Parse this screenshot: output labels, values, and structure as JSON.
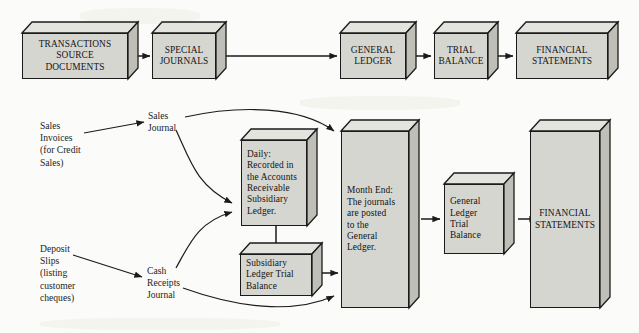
{
  "diagram": {
    "colors": {
      "box_face": "#d6d6d1",
      "box_top": "#e4e4df",
      "box_side": "#bfbfb8",
      "outline": "#1b1b1b",
      "background": "#fbfbf9"
    }
  },
  "top_row": {
    "boxes": [
      {
        "id": "transactions-source-documents",
        "label": "TRANSACTIONS\nSOURCE\nDOCUMENTS"
      },
      {
        "id": "special-journals",
        "label": "SPECIAL\nJOURNALS"
      },
      {
        "id": "general-ledger",
        "label": "GENERAL\nLEDGER"
      },
      {
        "id": "trial-balance",
        "label": "TRIAL\nBALANCE"
      },
      {
        "id": "financial-statements",
        "label": "FINANCIAL\nSTATEMENTS"
      }
    ],
    "connectors": [
      {
        "from": "transactions-source-documents",
        "to": "special-journals",
        "kind": "straight-arrow"
      },
      {
        "from": "special-journals",
        "to": "general-ledger",
        "kind": "straight-arrow"
      },
      {
        "from": "general-ledger",
        "to": "trial-balance",
        "kind": "straight-arrow"
      },
      {
        "from": "trial-balance",
        "to": "financial-statements",
        "kind": "straight-arrow"
      }
    ]
  },
  "bottom_row": {
    "source_labels": [
      {
        "id": "sales-invoices",
        "label": "Sales\nInvoices\n(for Credit\nSales)"
      },
      {
        "id": "deposit-slips",
        "label": "Deposit\nSlips\n(listing\ncustomer\ncheques)"
      }
    ],
    "journal_labels": [
      {
        "id": "sales-journal",
        "label": "Sales\nJournal"
      },
      {
        "id": "cash-receipts-journal",
        "label": "Cash\nReceipts\nJournal"
      }
    ],
    "boxes": [
      {
        "id": "daily-subsidiary-ledger",
        "label": "Daily:\nRecorded in\nthe Accounts\nReceivable\nSubsidiary\nLedger."
      },
      {
        "id": "subsidiary-ledger-trial-balance",
        "label": "Subsidiary\nLedger Trial\nBalance"
      },
      {
        "id": "month-end-general-ledger",
        "label": "Month End:\nThe journals\nare posted\nto the\nGeneral\nLedger."
      },
      {
        "id": "general-ledger-trial-balance",
        "label": "General\nLedger\nTrial\nBalance"
      },
      {
        "id": "financial-statements-bottom",
        "label": "FINANCIAL\nSTATEMENTS"
      }
    ],
    "connectors": [
      {
        "from": "sales-invoices",
        "to": "sales-journal",
        "kind": "straight-arrow"
      },
      {
        "from": "deposit-slips",
        "to": "cash-receipts-journal",
        "kind": "straight-arrow"
      },
      {
        "from": "sales-journal",
        "to": "month-end-general-ledger",
        "kind": "curved-arrow"
      },
      {
        "from": "sales-journal",
        "to": "daily-subsidiary-ledger",
        "kind": "curved-arrow"
      },
      {
        "from": "cash-receipts-journal",
        "to": "daily-subsidiary-ledger",
        "kind": "curved-arrow"
      },
      {
        "from": "cash-receipts-journal",
        "to": "month-end-general-ledger",
        "kind": "curved-arrow"
      },
      {
        "from": "daily-subsidiary-ledger",
        "to": "subsidiary-ledger-trial-balance",
        "kind": "straight-arrow"
      },
      {
        "from": "subsidiary-ledger-trial-balance",
        "to": "month-end-general-ledger",
        "kind": "double-arrow"
      },
      {
        "from": "month-end-general-ledger",
        "to": "general-ledger-trial-balance",
        "kind": "straight-arrow"
      },
      {
        "from": "general-ledger-trial-balance",
        "to": "financial-statements-bottom",
        "kind": "straight-arrow"
      }
    ]
  }
}
